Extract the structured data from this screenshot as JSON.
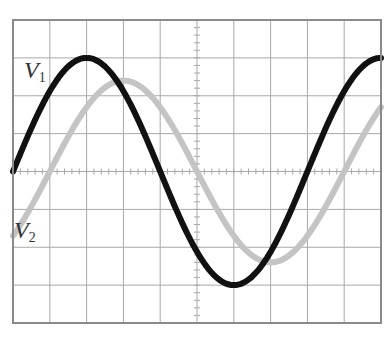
{
  "chart_data": {
    "type": "line",
    "title": "",
    "xlabel": "",
    "ylabel": "",
    "grid": true,
    "divisions": {
      "x": 10,
      "y": 8
    },
    "xlim": [
      0,
      10
    ],
    "ylim": [
      -4,
      4
    ],
    "legend_position": "inline-left",
    "series": [
      {
        "name": "V1",
        "label_main": "V",
        "label_sub": "1",
        "color": "#111111",
        "amplitude_div": 3.0,
        "period_div": 8,
        "phase_offset_div": 0,
        "description": "sinusoid starting at zero-crossing rising at x=0, peak at x=2, trough at x=6",
        "x": [
          0,
          1,
          2,
          3,
          4,
          5,
          6,
          7,
          8,
          9,
          10
        ],
        "values": [
          0,
          2.12,
          3.0,
          2.12,
          0,
          -2.12,
          -3.0,
          -2.12,
          0,
          2.12,
          3.0
        ]
      },
      {
        "name": "V2",
        "label_main": "V",
        "label_sub": "2",
        "color": "#c4c4c4",
        "amplitude_div": 2.4,
        "period_div": 8,
        "phase_offset_div": 1,
        "description": "sinusoid lagging V1 by one division (45 degrees), peak at x=3, trough at x=7",
        "x": [
          0,
          1,
          2,
          3,
          4,
          5,
          6,
          7,
          8,
          9,
          10
        ],
        "values": [
          -1.7,
          0,
          1.7,
          2.4,
          1.7,
          0,
          -1.7,
          -2.4,
          -1.7,
          0,
          1.7
        ]
      }
    ]
  },
  "labels": {
    "v1_main": "V",
    "v1_sub": "1",
    "v2_main": "V",
    "v2_sub": "2"
  },
  "layout": {
    "grid_left": 13,
    "grid_top": 20,
    "grid_right": 381,
    "grid_bottom": 323,
    "grid_color": "#a8a8a8",
    "border_color": "#8a8a8a"
  }
}
